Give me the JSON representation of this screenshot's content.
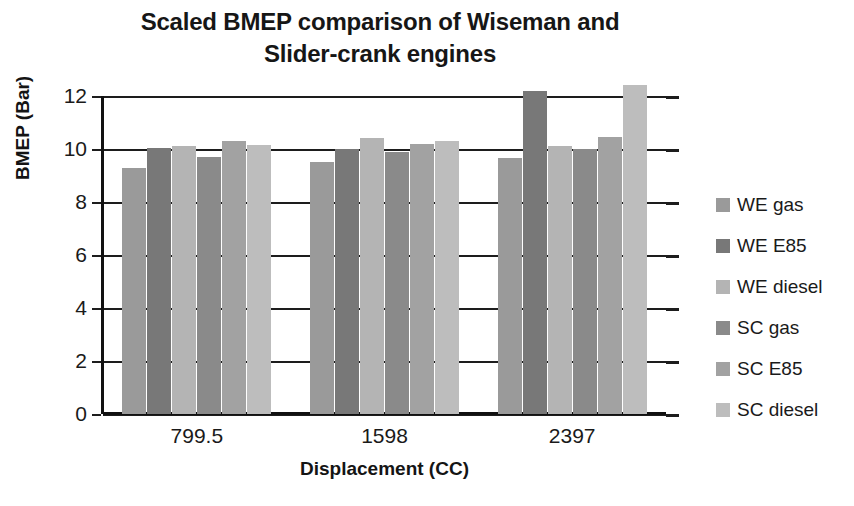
{
  "chart_data": {
    "type": "bar",
    "title": "Scaled BMEP comparison of Wiseman and Slider-crank engines",
    "title_lines": [
      "Scaled BMEP comparison of Wiseman and",
      "Slider-crank engines"
    ],
    "xlabel": "Displacement (CC)",
    "ylabel": "BMEP (Bar)",
    "categories": [
      "799.5",
      "1598",
      "2397"
    ],
    "ylim": [
      0,
      12
    ],
    "yticks": [
      0,
      2,
      4,
      6,
      8,
      10,
      12
    ],
    "ytick_labels": [
      "0",
      "2",
      "4",
      "6",
      "8",
      "10",
      "12"
    ],
    "grid": true,
    "legend_position": "right",
    "series": [
      {
        "name": "WE gas",
        "color": "#9a9a9a",
        "values": [
          9.3,
          9.5,
          9.65
        ]
      },
      {
        "name": "WE E85",
        "color": "#787878",
        "values": [
          10.05,
          10.0,
          12.2
        ]
      },
      {
        "name": "WE diesel",
        "color": "#b4b4b4",
        "values": [
          10.1,
          10.4,
          10.1
        ]
      },
      {
        "name": "SC gas",
        "color": "#8a8a8a",
        "values": [
          9.7,
          9.9,
          10.0
        ]
      },
      {
        "name": "SC E85",
        "color": "#a2a2a2",
        "values": [
          10.3,
          10.2,
          10.45
        ]
      },
      {
        "name": "SC diesel",
        "color": "#bdbdbd",
        "values": [
          10.15,
          10.3,
          12.4
        ]
      }
    ]
  },
  "axis": {
    "y_title": "BMEP (Bar)",
    "x_title": "Displacement (CC)"
  }
}
